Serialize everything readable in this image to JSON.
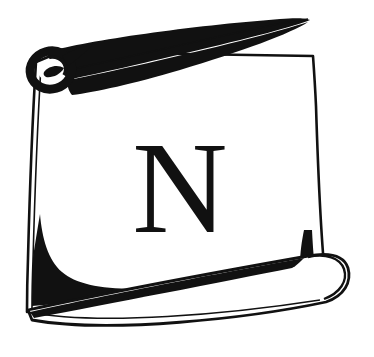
{
  "image": {
    "kind": "logo-illustration",
    "subject": "rolled scroll / parchment with a monogram letter",
    "width": 374,
    "height": 357,
    "background_color": "#ffffff",
    "ink_color": "#111111"
  },
  "logo": {
    "monogram": {
      "letter": "N",
      "style": "serif-capital",
      "color": "#111111"
    },
    "parts": {
      "sheet_label": "scroll-sheet",
      "top_roll_label": "top-rolled-edge",
      "bottom_roll_label": "bottom-rolled-edge",
      "curl_label": "scroll-curl-spiral",
      "shadow_label": "inner-shadow"
    }
  },
  "colors": {
    "ink": "#111111",
    "paper": "#ffffff",
    "outline": "#111111"
  }
}
